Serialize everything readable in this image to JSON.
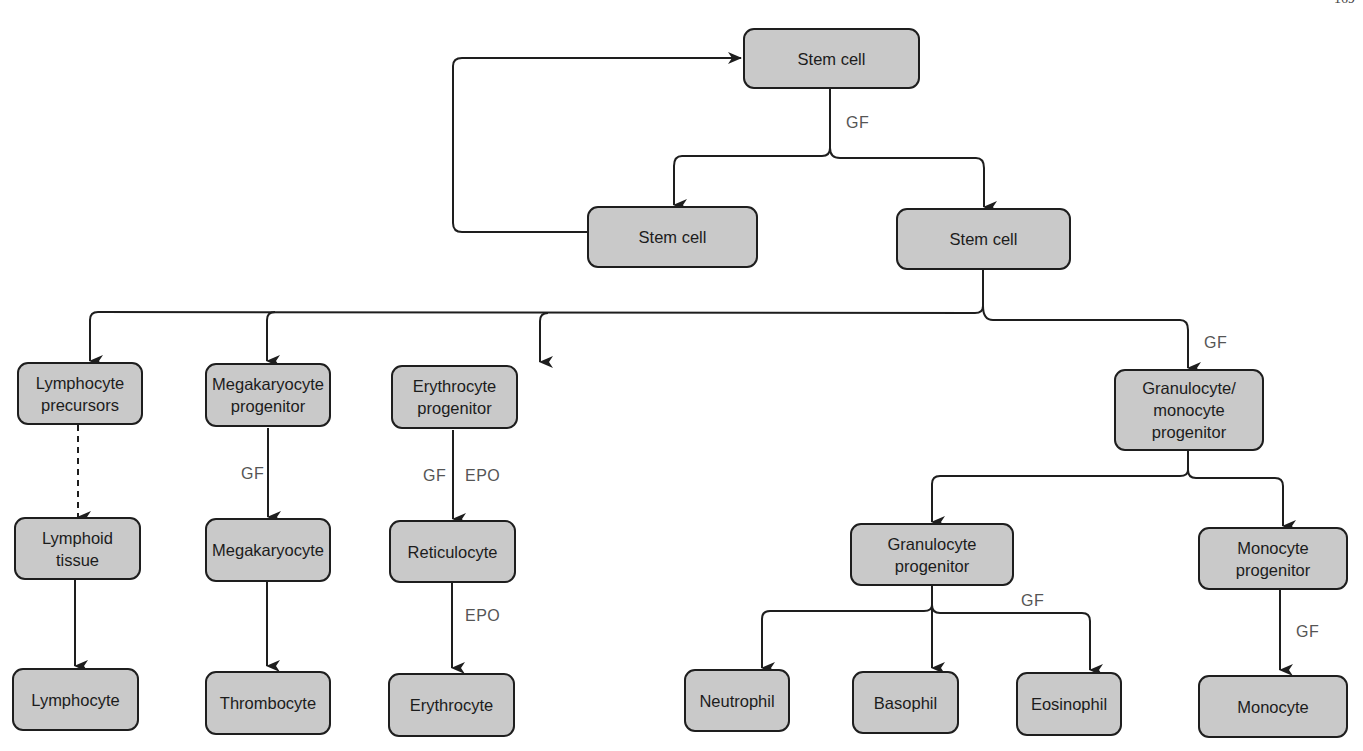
{
  "header": {
    "running_title": "",
    "page_number": "169"
  },
  "nodes": {
    "stem_top": "Stem cell",
    "stem_left": "Stem cell",
    "stem_right": "Stem cell",
    "lymph_precursors": "Lymphocyte\nprecursors",
    "mega_progenitor": "Megakaryocyte\nprogenitor",
    "ery_progenitor": "Erythrocyte\nprogenitor",
    "gm_progenitor": "Granulocyte/\nmonocyte\nprogenitor",
    "lymphoid_tissue": "Lymphoid\ntissue",
    "megakaryocyte": "Megakaryocyte",
    "reticulocyte": "Reticulocyte",
    "gran_progenitor": "Granulocyte\nprogenitor",
    "mono_progenitor": "Monocyte\nprogenitor",
    "lymphocyte": "Lymphocyte",
    "thrombocyte": "Thrombocyte",
    "erythrocyte": "Erythrocyte",
    "neutrophil": "Neutrophil",
    "basophil": "Basophil",
    "eosinophil": "Eosinophil",
    "monocyte": "Monocyte"
  },
  "edge_labels": {
    "stem_split_gf": "GF",
    "gm_gf": "GF",
    "mega_gf": "GF",
    "ery_gf": "GF",
    "ery_epo": "EPO",
    "retic_epo": "EPO",
    "gran_gf": "GF",
    "mono_gf": "GF"
  },
  "colors": {
    "node_fill": "#c9c9c9",
    "stroke": "#1e1e1e",
    "label": "#555555"
  }
}
